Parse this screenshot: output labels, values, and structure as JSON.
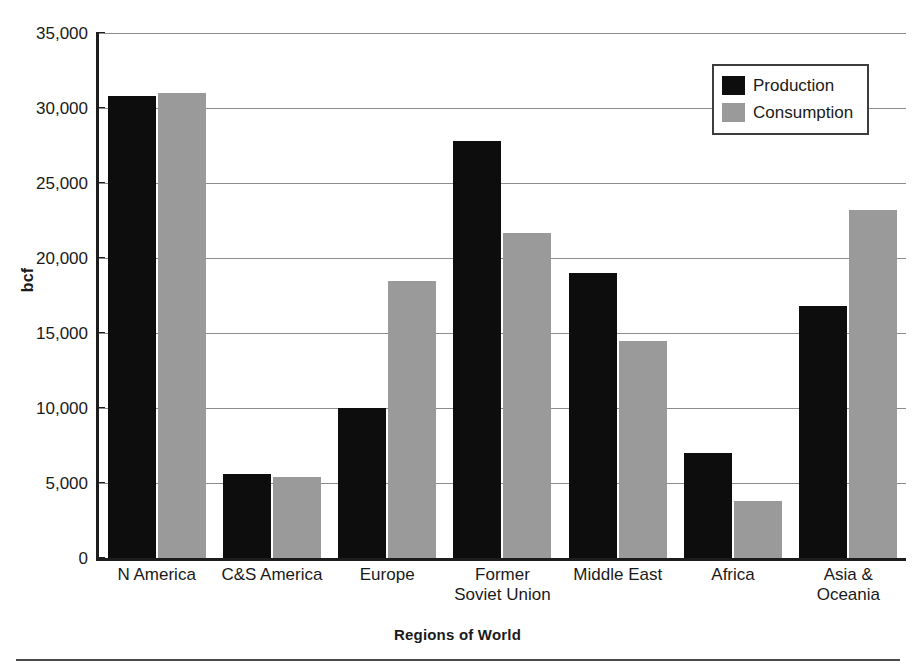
{
  "chart_data": {
    "type": "bar",
    "title": "",
    "xlabel": "Regions of World",
    "ylabel": "bcf",
    "ylim": [
      0,
      35000
    ],
    "yticks": [
      0,
      5000,
      10000,
      15000,
      20000,
      25000,
      30000,
      35000
    ],
    "ytick_labels": [
      "0",
      "5,000",
      "10,000",
      "15,000",
      "20,000",
      "25,000",
      "30,000",
      "35,000"
    ],
    "grid": true,
    "legend_position": "top-right",
    "categories": [
      "N America",
      "C&S America",
      "Europe",
      "Former\nSoviet Union",
      "Middle East",
      "Africa",
      "Asia &\nOceania"
    ],
    "series": [
      {
        "name": "Production",
        "color": "#0d0d0d",
        "values": [
          30800,
          5600,
          10000,
          27800,
          19000,
          7000,
          16800
        ]
      },
      {
        "name": "Consumption",
        "color": "#9a9a9a",
        "values": [
          31000,
          5400,
          18500,
          21700,
          14500,
          3800,
          23200
        ]
      }
    ]
  },
  "legend": {
    "items": [
      {
        "label": "Production",
        "swatch": "production"
      },
      {
        "label": "Consumption",
        "swatch": "consumption"
      }
    ]
  },
  "colors": {
    "production": "#0d0d0d",
    "consumption": "#9a9a9a",
    "axis": "#1d1d1d",
    "gridline": "#8d8d8d",
    "background": "#ffffff"
  }
}
